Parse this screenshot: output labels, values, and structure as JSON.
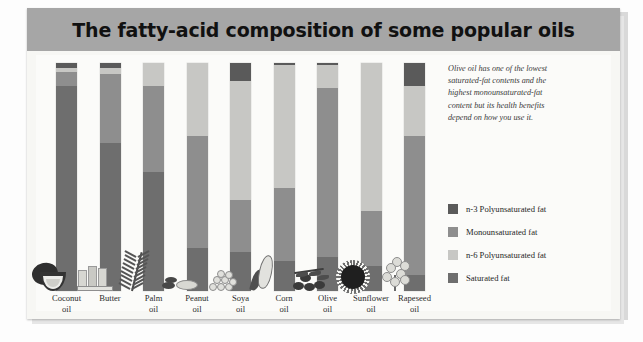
{
  "card": {
    "title": "The fatty-acid composition of some popular oils"
  },
  "annotation": {
    "text": "Olive oil has one of the lowest saturated-fat contents and the highest monounsaturated-fat content but its health benefits depend on how you use it."
  },
  "legend": {
    "items": [
      {
        "label": "n-3 Polyunsaturated fat",
        "color": "#5a5a5a"
      },
      {
        "label": "Monounsaturated fat",
        "color": "#8e8e8e"
      },
      {
        "label": "n-6 Polyunsaturated fat",
        "color": "#c7c7c4"
      },
      {
        "label": "Saturated fat",
        "color": "#6e6e6e"
      }
    ]
  },
  "chart_data": {
    "type": "bar",
    "title": "The fatty-acid composition of some popular oils",
    "subtitle": "",
    "xlabel": "",
    "ylabel": "",
    "ylim": [
      0,
      100
    ],
    "stacked": true,
    "normalized_percent": true,
    "grid": false,
    "legend_position": "right",
    "stack_order_top_to_bottom": [
      "n-3 Polyunsaturated fat",
      "n-6 Polyunsaturated fat",
      "Monounsaturated fat",
      "Saturated fat"
    ],
    "categories": [
      "Coconut oil",
      "Butter",
      "Palm oil",
      "Peanut oil",
      "Soya oil",
      "Corn oil",
      "Olive oil",
      "Sunflower oil",
      "Rapeseed oil"
    ],
    "category_lines": [
      [
        "Coconut",
        "oil"
      ],
      [
        "Butter",
        ""
      ],
      [
        "Palm",
        "oil"
      ],
      [
        "Peanut",
        "oil"
      ],
      [
        "Soya",
        "oil"
      ],
      [
        "Corn",
        "oil"
      ],
      [
        "Olive",
        "oil"
      ],
      [
        "Sunflower",
        "oil"
      ],
      [
        "Rapeseed",
        "oil"
      ]
    ],
    "series": [
      {
        "name": "n-3 Polyunsaturated fat",
        "color": "#5a5a5a",
        "values": [
          2,
          2,
          0,
          0,
          8,
          1,
          1,
          0,
          10
        ]
      },
      {
        "name": "n-6 Polyunsaturated fat",
        "color": "#c7c7c4",
        "values": [
          2,
          3,
          10,
          32,
          52,
          54,
          10,
          65,
          22
        ]
      },
      {
        "name": "Monounsaturated fat",
        "color": "#8e8e8e",
        "values": [
          6,
          30,
          38,
          49,
          23,
          32,
          74,
          24,
          61
        ]
      },
      {
        "name": "Saturated fat",
        "color": "#6e6e6e",
        "values": [
          90,
          65,
          52,
          19,
          17,
          13,
          15,
          11,
          7
        ]
      }
    ],
    "icons": [
      "coconut",
      "butter-sticks",
      "palm-frond",
      "peanuts",
      "soya-beans",
      "corn-cob",
      "olives",
      "sunflower",
      "rapeseed-flowers"
    ]
  }
}
